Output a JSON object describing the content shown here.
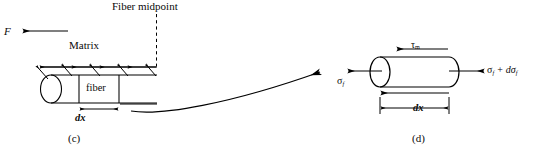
{
  "figure": {
    "type": "engineering-diagram",
    "background_color": "#ffffff",
    "line_color": "#000000"
  },
  "panel_c": {
    "caption": "(c)",
    "force_label": "F",
    "matrix_label": "Matrix",
    "fiber_midpoint_label": "Fiber midpoint",
    "fiber_label": "fiber",
    "dx_label": "dx",
    "shear_arrow_count": 5,
    "arrow_direction": "left"
  },
  "panel_d": {
    "caption": "(d)",
    "tau": {
      "symbol": "τ",
      "subscript": "m",
      "full": "τm"
    },
    "sigma_left": {
      "symbol": "σ",
      "subscript": "f",
      "full": "σf"
    },
    "sigma_right": {
      "symbol": "σ",
      "subscript": "f",
      "plus": "+",
      "differential": "dσ",
      "differential_subscript": "f",
      "full": "σf + dσf"
    },
    "dx_label": "dx",
    "element_shape": "cylinder"
  },
  "connector": {
    "type": "curved-arrow",
    "direction": "left-to-right",
    "meaning": "magnified detail of element"
  }
}
